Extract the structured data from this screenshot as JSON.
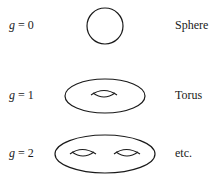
{
  "diagram": {
    "rows": [
      {
        "var": "g",
        "eq": " = 0",
        "name": "Sphere",
        "holes": 0
      },
      {
        "var": "g",
        "eq": " = 1",
        "name": "Torus",
        "holes": 1
      },
      {
        "var": "g",
        "eq": " = 2",
        "name": "etc.",
        "holes": 2
      }
    ]
  }
}
